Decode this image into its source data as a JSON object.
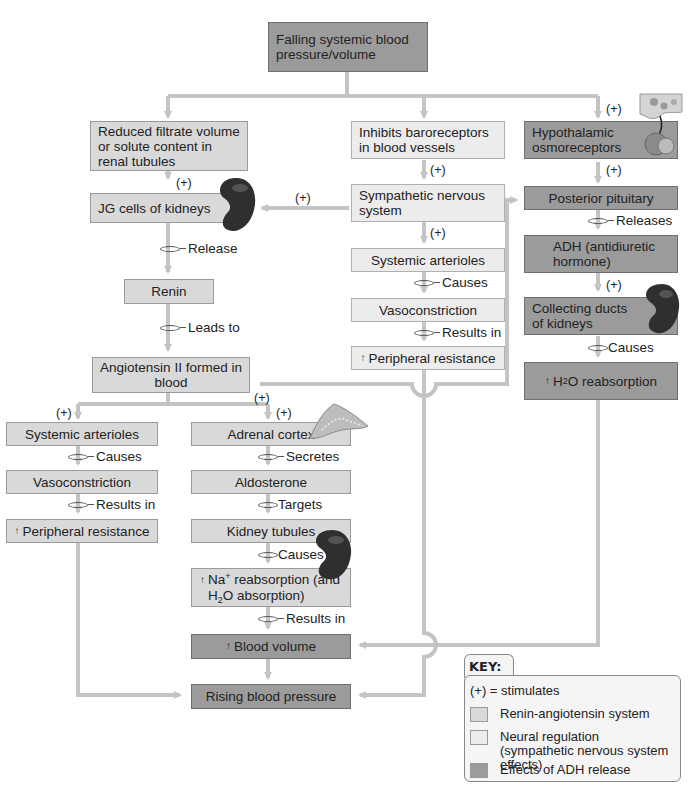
{
  "diagram": {
    "title": "Falling systemic blood pressure/volume",
    "nodes": {
      "falling": "Falling systemic blood pressure/volume",
      "reduced_filtrate": "Reduced filtrate volume or solute content in renal tubules",
      "jg_cells": "JG cells of kidneys",
      "renin": "Renin",
      "angiotensin": "Angiotensin II formed in blood",
      "left_arterioles": "Systemic arterioles",
      "left_vasoconstriction": "Vasoconstriction",
      "left_peripheral": "Peripheral resistance",
      "adrenal_cortex": "Adrenal cortex",
      "aldosterone": "Aldosterone",
      "kidney_tubules": "Kidney tubules",
      "na_reabsorption_a": "Na",
      "na_reabsorption_b": " reabsorption (and",
      "na_reabsorption_c": "O absorption)",
      "blood_volume": "Blood volume",
      "rising_bp": "Rising blood pressure",
      "baroreceptors": "Inhibits baroreceptors in blood vessels",
      "sympathetic": "Sympathetic nervous system",
      "mid_arterioles": "Systemic arterioles",
      "mid_vasoconstriction": "Vasoconstriction",
      "mid_peripheral": "Peripheral resistance",
      "osmoreceptors": "Hypothalamic osmoreceptors",
      "posterior_pituitary": "Posterior pituitary",
      "adh": "ADH (antidiuretic hormone)",
      "collecting_ducts": "Collecting ducts of kidneys",
      "h2o_reabsorption": "O reabsorption"
    },
    "symbols": {
      "plus": "(+)",
      "increase": "↑",
      "h": "H",
      "two": "2",
      "sup_plus": "+"
    },
    "connectors": {
      "release": "Release",
      "leads_to": "Leads to",
      "causes": "Causes",
      "results_in": "Results in",
      "secretes": "Secretes",
      "targets": "Targets",
      "releases": "Releases"
    },
    "icons": [
      "kidney-icon",
      "adrenal-gland-icon",
      "hypothalamus-pituitary-icon"
    ]
  },
  "key": {
    "title": "KEY:",
    "stimulates": "(+) = stimulates",
    "items": [
      {
        "label": "Renin-angiotensin system",
        "color": "#d9d9d9"
      },
      {
        "label": "Neural regulation (sympathetic nervous system effects)",
        "color": "#ececec"
      },
      {
        "label": "Effects of ADH release",
        "color": "#9b9b9b"
      }
    ]
  },
  "colors": {
    "renin_angiotensin": "#d9d9d9",
    "neural": "#ececec",
    "adh": "#9b9b9b",
    "arrow": "#c4c4c4"
  }
}
